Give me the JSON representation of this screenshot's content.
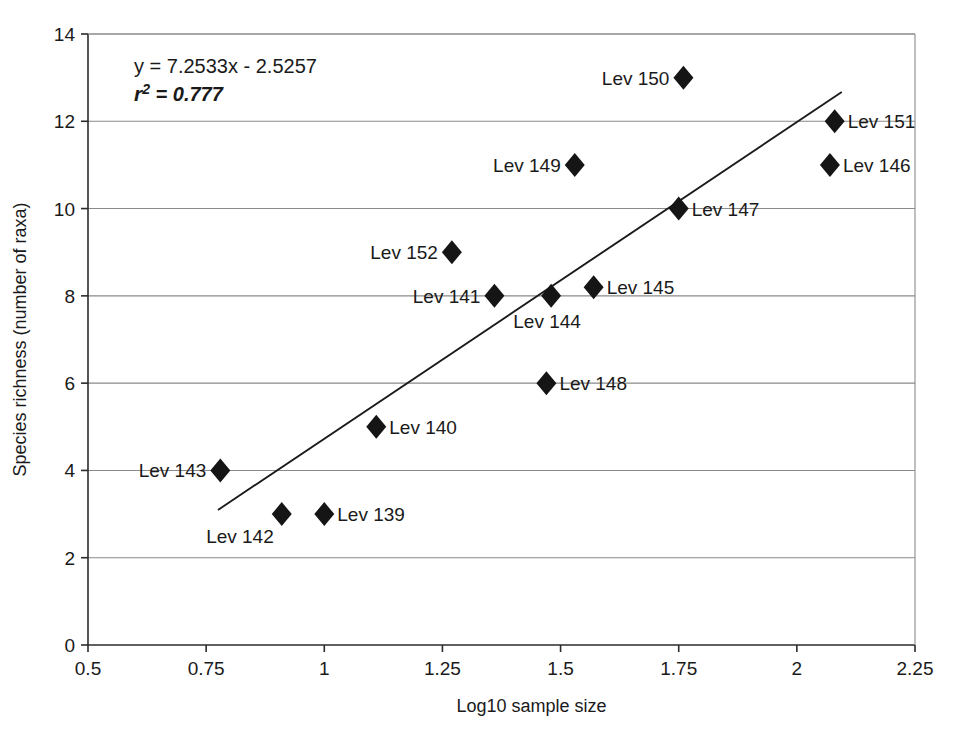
{
  "chart_data": {
    "type": "scatter",
    "title": "",
    "xlabel": "Log10 sample size",
    "ylabel": "Species richness (number of raxa)",
    "xlim": [
      0.5,
      2.25
    ],
    "ylim": [
      0,
      14
    ],
    "xticks": [
      "0.5",
      "0.75",
      "1",
      "1.25",
      "1.5",
      "1.75",
      "2",
      "2.25"
    ],
    "xtick_values": [
      0.5,
      0.75,
      1,
      1.25,
      1.5,
      1.75,
      2,
      2.25
    ],
    "yticks": [
      "0",
      "2",
      "4",
      "6",
      "8",
      "10",
      "12",
      "14"
    ],
    "ytick_values": [
      0,
      2,
      4,
      6,
      8,
      10,
      12,
      14
    ],
    "grid": "horizontal",
    "legend": "none",
    "marker": "filled-diamond",
    "annotations": {
      "equation": "y = 7.2533x - 2.5257",
      "r_symbol": "r",
      "r_exponent": "2",
      "r_equals": "= 0.777",
      "r_squared_value": 0.777,
      "slope": 7.2533,
      "intercept": -2.5257
    },
    "trendline": {
      "type": "linear",
      "x_start": 0.775,
      "y_start": 3.095,
      "x_end": 2.095,
      "y_end": 12.67
    },
    "points": [
      {
        "label": "Lev 143",
        "x": 0.78,
        "y": 4,
        "label_pos": "left"
      },
      {
        "label": "Lev 142",
        "x": 0.91,
        "y": 3,
        "label_pos": "below-left"
      },
      {
        "label": "Lev 139",
        "x": 1.0,
        "y": 3,
        "label_pos": "right"
      },
      {
        "label": "Lev 140",
        "x": 1.11,
        "y": 5,
        "label_pos": "right"
      },
      {
        "label": "Lev 152",
        "x": 1.27,
        "y": 9,
        "label_pos": "left"
      },
      {
        "label": "Lev 141",
        "x": 1.36,
        "y": 8,
        "label_pos": "left"
      },
      {
        "label": "Lev 148",
        "x": 1.47,
        "y": 6,
        "label_pos": "right"
      },
      {
        "label": "Lev 144",
        "x": 1.48,
        "y": 8,
        "label_pos": "below-mid"
      },
      {
        "label": "Lev 149",
        "x": 1.53,
        "y": 11,
        "label_pos": "left"
      },
      {
        "label": "Lev 145",
        "x": 1.57,
        "y": 8.2,
        "label_pos": "right"
      },
      {
        "label": "Lev 147",
        "x": 1.75,
        "y": 10,
        "label_pos": "right"
      },
      {
        "label": "Lev 150",
        "x": 1.76,
        "y": 13,
        "label_pos": "left"
      },
      {
        "label": "Lev 146",
        "x": 2.07,
        "y": 11,
        "label_pos": "right"
      },
      {
        "label": "Lev 151",
        "x": 2.08,
        "y": 12,
        "label_pos": "right"
      }
    ]
  }
}
